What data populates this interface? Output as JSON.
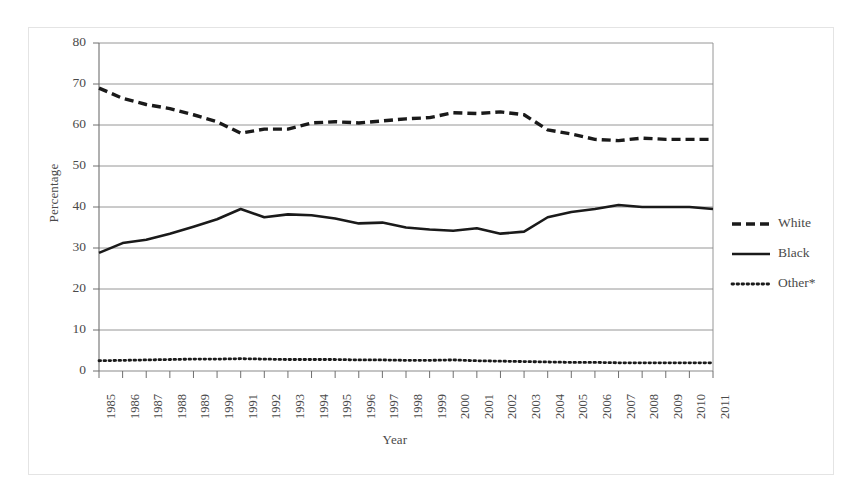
{
  "figure": {
    "border_color": "#e4e4e4",
    "background": "#ffffff"
  },
  "axis": {
    "y_title": "Percentage",
    "x_title": "Year",
    "y_ticks": [
      "80",
      "70",
      "60",
      "50",
      "40",
      "30",
      "20",
      "10",
      "0"
    ]
  },
  "legend": {
    "position": "right",
    "items": [
      {
        "label": "White",
        "style": "dashed",
        "color": "#1a1a1a"
      },
      {
        "label": "Black",
        "style": "solid",
        "color": "#1a1a1a"
      },
      {
        "label": "Other*",
        "style": "dotted",
        "color": "#1a1a1a"
      }
    ]
  },
  "chart_data": {
    "type": "line",
    "title": "",
    "xlabel": "Year",
    "ylabel": "Percentage",
    "ylim": [
      0,
      80
    ],
    "ytick_step": 10,
    "grid": true,
    "grid_axis": "y",
    "legend_position": "right",
    "categories": [
      "1985",
      "1986",
      "1987",
      "1988",
      "1989",
      "1990",
      "1991",
      "1992",
      "1993",
      "1994",
      "1995",
      "1996",
      "1997",
      "1998",
      "1999",
      "2000",
      "2001",
      "2002",
      "2003",
      "2004",
      "2005",
      "2006",
      "2007",
      "2008",
      "2009",
      "2010",
      "2011"
    ],
    "series": [
      {
        "name": "White",
        "style": "dashed",
        "color": "#1a1a1a",
        "values": [
          69.0,
          66.5,
          65.0,
          64.0,
          62.5,
          60.8,
          58.0,
          59.0,
          59.0,
          60.5,
          60.8,
          60.5,
          61.0,
          61.5,
          61.8,
          63.0,
          62.8,
          63.2,
          62.5,
          58.8,
          57.8,
          56.5,
          56.2,
          56.8,
          56.5,
          56.5,
          56.5
        ]
      },
      {
        "name": "Black",
        "style": "solid",
        "color": "#1a1a1a",
        "values": [
          28.8,
          31.2,
          32.0,
          33.5,
          35.2,
          37.0,
          39.5,
          37.5,
          38.2,
          38.0,
          37.2,
          36.0,
          36.2,
          35.0,
          34.5,
          34.2,
          34.8,
          33.5,
          34.0,
          37.5,
          38.8,
          39.5,
          40.5,
          40.0,
          40.0,
          40.0,
          39.5
        ]
      },
      {
        "name": "Other*",
        "style": "dotted",
        "color": "#1a1a1a",
        "values": [
          2.5,
          2.6,
          2.7,
          2.8,
          2.9,
          2.9,
          3.0,
          2.9,
          2.8,
          2.8,
          2.8,
          2.7,
          2.7,
          2.6,
          2.6,
          2.7,
          2.5,
          2.4,
          2.3,
          2.2,
          2.1,
          2.1,
          2.0,
          2.0,
          2.0,
          2.0,
          2.0
        ]
      }
    ]
  }
}
